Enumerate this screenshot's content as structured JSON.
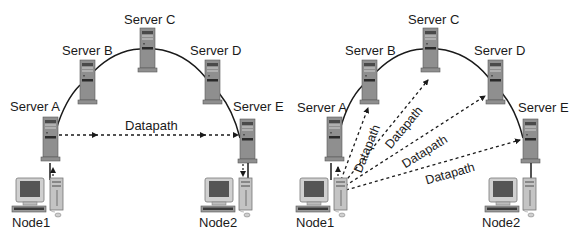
{
  "diagrams": [
    {
      "id": "left",
      "description": "Traffic routed through ring of servers",
      "servers": [
        {
          "label": "Server A"
        },
        {
          "label": "Server B"
        },
        {
          "label": "Server C"
        },
        {
          "label": "Server D"
        },
        {
          "label": "Server E"
        }
      ],
      "nodes": [
        {
          "label": "Node1"
        },
        {
          "label": "Node2"
        }
      ],
      "datapaths": [
        {
          "label": "Datapath",
          "from": "Server A",
          "to": "Server E"
        }
      ]
    },
    {
      "id": "right",
      "description": "Direct datapaths from Node1 to each server",
      "servers": [
        {
          "label": "Server A"
        },
        {
          "label": "Server B"
        },
        {
          "label": "Server C"
        },
        {
          "label": "Server D"
        },
        {
          "label": "Server E"
        }
      ],
      "nodes": [
        {
          "label": "Node1"
        },
        {
          "label": "Node2"
        }
      ],
      "datapaths": [
        {
          "label": "Datapath",
          "from": "Node1",
          "to": "Server B"
        },
        {
          "label": "Datapath",
          "from": "Node1",
          "to": "Server C"
        },
        {
          "label": "Datapath",
          "from": "Node1",
          "to": "Server D"
        },
        {
          "label": "Datapath",
          "from": "Node1",
          "to": "Server E"
        }
      ]
    }
  ],
  "colors": {
    "background": "#ffffff",
    "server_body": "#8f8f8f",
    "server_dark": "#3a3a3a",
    "ring_line": "#1a1a1a",
    "dashed_line": "#1a1a1a",
    "text": "#1a1a1a"
  }
}
